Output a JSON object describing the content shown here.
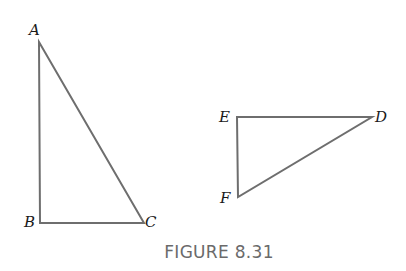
{
  "figure": {
    "caption": "FIGURE 8.31",
    "stroke_color": "#6e6e6e",
    "triangles": [
      {
        "name": "ABC",
        "vertices": {
          "A": {
            "label": "A",
            "x": 39,
            "y": 42
          },
          "B": {
            "label": "B",
            "x": 40,
            "y": 223
          },
          "C": {
            "label": "C",
            "x": 144,
            "y": 223
          }
        },
        "right_angle_at": "B"
      },
      {
        "name": "EDF",
        "vertices": {
          "E": {
            "label": "E",
            "x": 237,
            "y": 117
          },
          "D": {
            "label": "D",
            "x": 372,
            "y": 117
          },
          "F": {
            "label": "F",
            "x": 238,
            "y": 197
          }
        },
        "right_angle_at": "E"
      }
    ]
  }
}
